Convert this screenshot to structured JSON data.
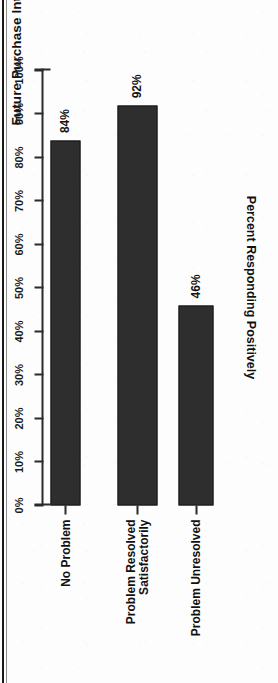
{
  "figure": {
    "title": "Future Purchase Intent",
    "bar_color": "#2e2e2e",
    "axis_color": "#2b2b2b",
    "background": "#fdfdfd"
  },
  "chart_data": {
    "type": "bar",
    "title": "Future Purchase Intent",
    "orientation": "vertical-rotated-90ccw",
    "categories": [
      "No Problem",
      "Problem Resolved\nSatisfactorily",
      "Problem Unresolved"
    ],
    "values": [
      84,
      92,
      46
    ],
    "value_labels": [
      "84%",
      "92%",
      "46%"
    ],
    "xlabel": "",
    "ylabel": "Percent Responding Positively",
    "ylim": [
      0,
      100
    ],
    "ytick_values": [
      0,
      10,
      20,
      30,
      40,
      50,
      60,
      70,
      80,
      90,
      100
    ],
    "ytick_labels": [
      "0%",
      "10%",
      "20%",
      "30%",
      "40%",
      "50%",
      "60%",
      "70%",
      "80%",
      "90%",
      "100%"
    ],
    "grid": false,
    "legend": null
  }
}
